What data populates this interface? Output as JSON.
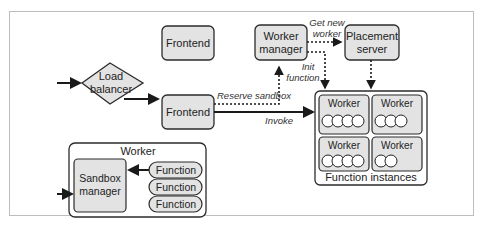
{
  "diagram": {
    "nodes": {
      "load_balancer": [
        "Load",
        "balancer"
      ],
      "frontend_idle": "Frontend",
      "frontend_active": "Frontend",
      "worker_manager": [
        "Worker",
        "manager"
      ],
      "placement_server": [
        "Placement",
        "server"
      ],
      "function_instances": {
        "title": "Function instances",
        "workers": [
          {
            "label": "Worker",
            "functions": 4
          },
          {
            "label": "Worker",
            "functions": 3
          },
          {
            "label": "Worker",
            "functions": 4
          },
          {
            "label": "Worker",
            "functions": 2
          }
        ]
      },
      "worker_detail": {
        "title": "Worker",
        "sandbox_manager": [
          "Sandbox",
          "manager"
        ],
        "functions": [
          "Function",
          "Function",
          "Function"
        ]
      }
    },
    "edges": {
      "reserve_sandbox": "Reserve sandbox",
      "invoke": "Invoke",
      "get_new_worker": [
        "Get new",
        "worker"
      ],
      "init_function": [
        "Init",
        "function"
      ]
    },
    "colors": {
      "node_fill": "#e3e3e3",
      "stroke": "#2b2b2b",
      "frame": "#bdbdbd"
    }
  }
}
